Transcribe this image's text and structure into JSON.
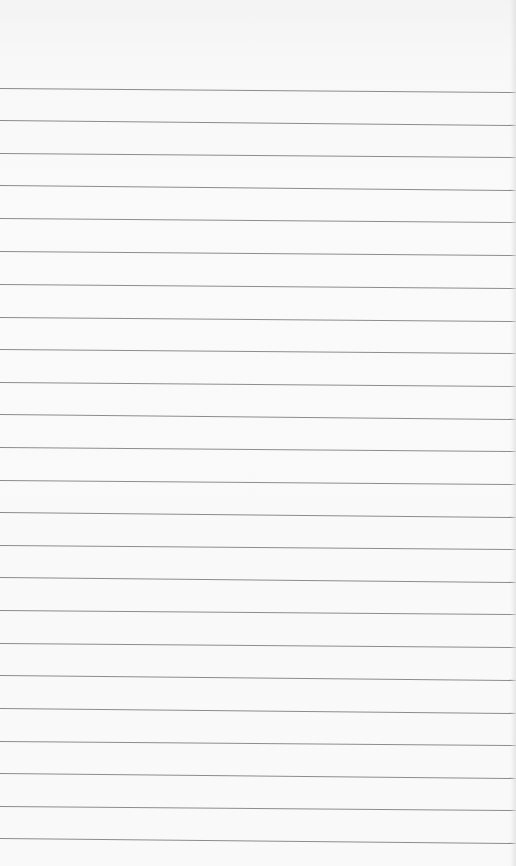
{
  "page": {
    "type": "lined-notepad-paper",
    "width": 516,
    "height": 866,
    "background_color": "#f8f8f8",
    "line_color": "#8c8c8c",
    "line_count": 24,
    "lines": [
      {
        "y_left": 88,
        "y_right": 92
      },
      {
        "y_left": 120,
        "y_right": 125
      },
      {
        "y_left": 153,
        "y_right": 157
      },
      {
        "y_left": 185,
        "y_right": 190
      },
      {
        "y_left": 218,
        "y_right": 222
      },
      {
        "y_left": 251,
        "y_right": 255
      },
      {
        "y_left": 284,
        "y_right": 288
      },
      {
        "y_left": 317,
        "y_right": 321
      },
      {
        "y_left": 349,
        "y_right": 353
      },
      {
        "y_left": 382,
        "y_right": 386
      },
      {
        "y_left": 414,
        "y_right": 419
      },
      {
        "y_left": 447,
        "y_right": 451
      },
      {
        "y_left": 480,
        "y_right": 484
      },
      {
        "y_left": 512,
        "y_right": 517
      },
      {
        "y_left": 545,
        "y_right": 549
      },
      {
        "y_left": 577,
        "y_right": 582
      },
      {
        "y_left": 610,
        "y_right": 614
      },
      {
        "y_left": 643,
        "y_right": 647
      },
      {
        "y_left": 675,
        "y_right": 680
      },
      {
        "y_left": 708,
        "y_right": 713
      },
      {
        "y_left": 741,
        "y_right": 745
      },
      {
        "y_left": 773,
        "y_right": 778
      },
      {
        "y_left": 806,
        "y_right": 810
      },
      {
        "y_left": 838,
        "y_right": 843
      }
    ],
    "text_lines": []
  }
}
